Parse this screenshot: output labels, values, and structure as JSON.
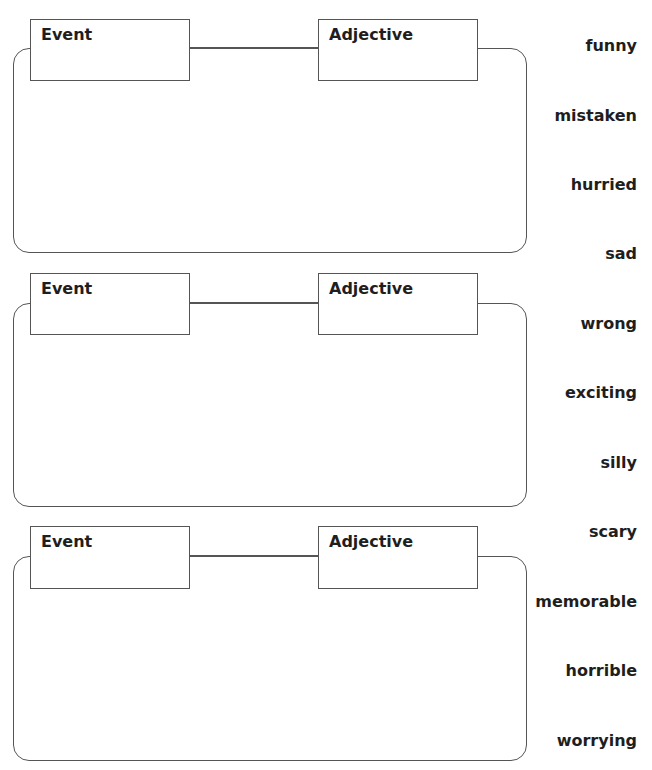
{
  "sections": [
    {
      "event_label": "Event",
      "adjective_label": "Adjective",
      "box_top": 19,
      "outer_top": 48,
      "outer_bottom": 253
    },
    {
      "event_label": "Event",
      "adjective_label": "Adjective",
      "box_top": 273,
      "outer_top": 303,
      "outer_bottom": 507
    },
    {
      "event_label": "Event",
      "adjective_label": "Adjective",
      "box_top": 526,
      "outer_top": 556,
      "outer_bottom": 761
    }
  ],
  "word_bank": [
    {
      "word": "funny",
      "y": 36
    },
    {
      "word": "mistaken",
      "y": 106
    },
    {
      "word": "hurried",
      "y": 175
    },
    {
      "word": "sad",
      "y": 244
    },
    {
      "word": "wrong",
      "y": 314
    },
    {
      "word": "exciting",
      "y": 383
    },
    {
      "word": "silly",
      "y": 453
    },
    {
      "word": "scary",
      "y": 522
    },
    {
      "word": "memorable",
      "y": 592
    },
    {
      "word": "horrible",
      "y": 661
    },
    {
      "word": "worrying",
      "y": 731
    }
  ],
  "colors": {
    "line": "#555555",
    "text": "#1e1e1e",
    "background": "#ffffff"
  }
}
